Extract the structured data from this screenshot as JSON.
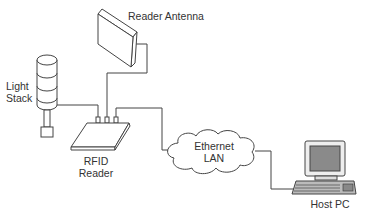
{
  "diagram": {
    "nodes": {
      "antenna": {
        "label": "Reader Antenna"
      },
      "light_stack": {
        "label_line1": "Light",
        "label_line2": "Stack"
      },
      "reader": {
        "label_line1": "RFID",
        "label_line2": "Reader"
      },
      "network": {
        "label_line1": "Ethernet",
        "label_line2": "LAN"
      },
      "host": {
        "label": "Host PC"
      }
    },
    "connections": [
      {
        "from": "reader",
        "to": "light_stack"
      },
      {
        "from": "reader",
        "to": "antenna"
      },
      {
        "from": "reader",
        "to": "network"
      },
      {
        "from": "network",
        "to": "host"
      }
    ],
    "colors": {
      "line": "#444444",
      "screen": "#8a8a8a",
      "background": "#ffffff"
    }
  }
}
